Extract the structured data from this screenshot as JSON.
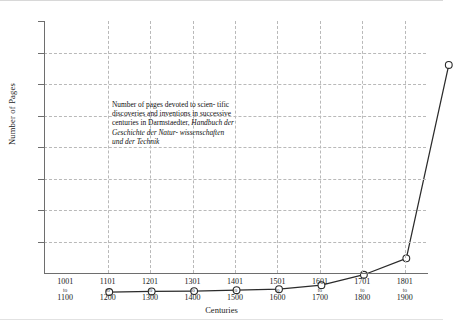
{
  "chart_data": {
    "type": "line",
    "title": "",
    "xlabel": "Centuries",
    "ylabel": "Number of Pages",
    "categories": [
      "1001 to 1100",
      "1101 to 1200",
      "1201 to 1300",
      "1301 to 1400",
      "1401 to 1500",
      "1501 to 1600",
      "1601 to 1700",
      "1701 to 1800",
      "1801 to 1900"
    ],
    "category_parts": [
      {
        "start": "1001",
        "sep": "to",
        "end": "1100"
      },
      {
        "start": "1101",
        "sep": "to",
        "end": "1200"
      },
      {
        "start": "1201",
        "sep": "to",
        "end": "1300"
      },
      {
        "start": "1301",
        "sep": "to",
        "end": "1400"
      },
      {
        "start": "1401",
        "sep": "to",
        "end": "1500"
      },
      {
        "start": "1501",
        "sep": "to",
        "end": "1600"
      },
      {
        "start": "1601",
        "sep": "to",
        "end": "1700"
      },
      {
        "start": "1701",
        "sep": "to",
        "end": "1800"
      },
      {
        "start": "1801",
        "sep": "to",
        "end": "1900"
      }
    ],
    "values": [
      3,
      5,
      6,
      9,
      12,
      25,
      58,
      110,
      724
    ],
    "ylim": [
      0,
      800
    ],
    "yticks": [
      0,
      100,
      200,
      300,
      400,
      500,
      600,
      700,
      800
    ],
    "grid": true,
    "legend": false,
    "marker": "open-circle",
    "line_color": "#2b2b2b",
    "grid_color": "#b9b9b9",
    "axis_color": "#6e6e6e",
    "annotation": {
      "line1": "Number of pages devoted to scien-",
      "line2": "tific discoveries and inventions in",
      "line3": "successive centuries in Darmstaedter,",
      "line4_italic": "Handbuch der Geschichte der Natur-",
      "line5_italic": "wissenschaften und der Technik"
    }
  }
}
